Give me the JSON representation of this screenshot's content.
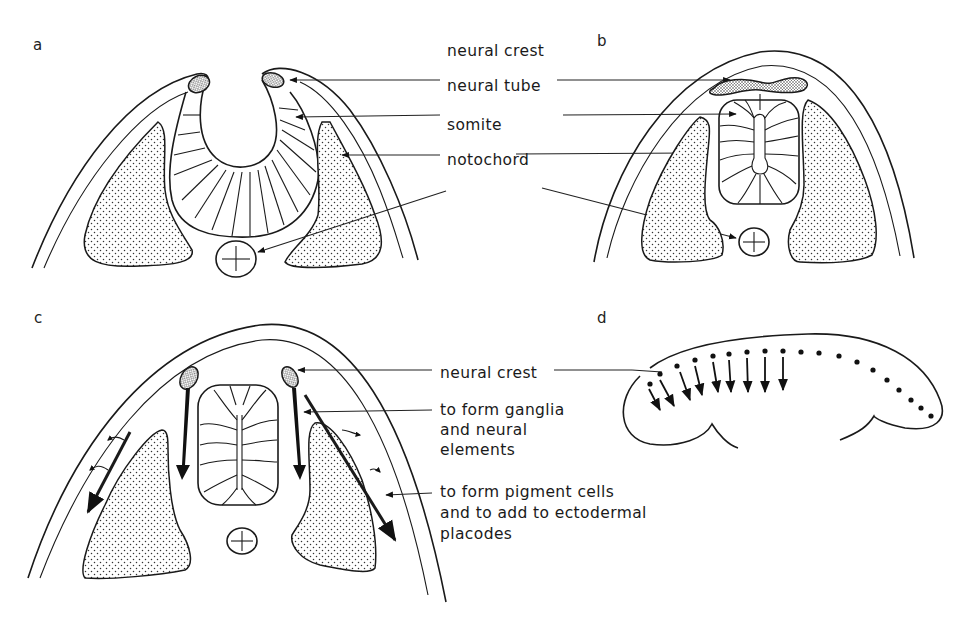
{
  "figure": {
    "panels": [
      {
        "id": "a",
        "letter": "a"
      },
      {
        "id": "b",
        "letter": "b"
      },
      {
        "id": "c",
        "letter": "c"
      },
      {
        "id": "d",
        "letter": "d"
      }
    ],
    "labels_top": {
      "neural_crest": "neural crest",
      "neural_tube": "neural tube",
      "somite": "somite",
      "notochord": "notochord"
    },
    "labels_bottom": {
      "neural_crest": "neural crest",
      "ganglia": [
        "to form ganglia",
        "and neural",
        "elements"
      ],
      "pigment": [
        "to form pigment cells",
        "and to add to ectodermal",
        "placodes"
      ]
    },
    "colors": {
      "ink": "#1a1a1a",
      "background": "#ffffff"
    }
  }
}
